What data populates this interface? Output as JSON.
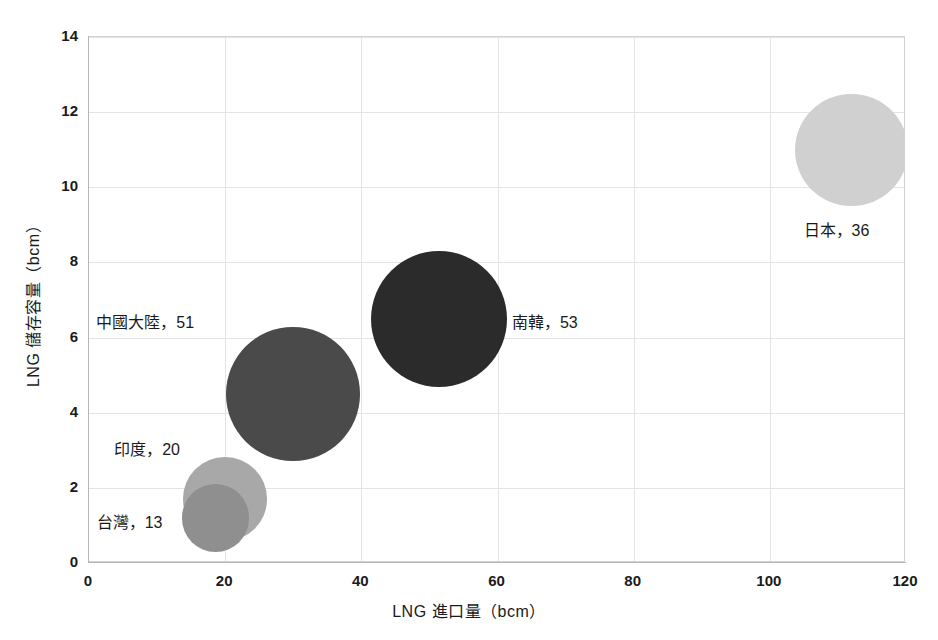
{
  "chart_data": {
    "type": "scatter",
    "subtype": "bubble",
    "title": "",
    "xlabel": "LNG 進口量（bcm）",
    "ylabel": "LNG 儲存容量（bcm）",
    "xlim": [
      0,
      120
    ],
    "ylim": [
      0,
      14
    ],
    "xticks": [
      "0",
      "20",
      "40",
      "60",
      "80",
      "100",
      "120"
    ],
    "yticks": [
      "0",
      "2",
      "4",
      "6",
      "8",
      "10",
      "12",
      "14"
    ],
    "xtick_values": [
      0,
      20,
      40,
      60,
      80,
      100,
      120
    ],
    "ytick_values": [
      0,
      2,
      4,
      6,
      8,
      10,
      12,
      14
    ],
    "grid": true,
    "legend": "none",
    "points": [
      {
        "name": "台灣",
        "label": "台灣，13",
        "x": 18.6,
        "y": 1.2,
        "size": 13,
        "color": "#8f8f8f",
        "label_pos": "left"
      },
      {
        "name": "印度",
        "label": "印度，20",
        "x": 20.0,
        "y": 1.7,
        "size": 20,
        "color": "#a8a8a8",
        "label_pos": "upper-left"
      },
      {
        "name": "中國大陸",
        "label": "中國大陸，51",
        "x": 30.0,
        "y": 4.5,
        "size": 51,
        "color": "#4a4a4a",
        "label_pos": "upper-left"
      },
      {
        "name": "南韓",
        "label": "南韓，53",
        "x": 51.4,
        "y": 6.5,
        "size": 53,
        "color": "#2b2b2b",
        "label_pos": "right"
      },
      {
        "name": "日本",
        "label": "日本，36",
        "x": 112.0,
        "y": 11.0,
        "size": 36,
        "color": "#d0d0d0",
        "label_pos": "below"
      }
    ]
  },
  "axes": {
    "x_title": "LNG 進口量（bcm）",
    "y_title": "LNG 儲存容量（bcm）",
    "x_ticks": [
      "0",
      "20",
      "40",
      "60",
      "80",
      "100",
      "120"
    ],
    "y_ticks": [
      "0",
      "2",
      "4",
      "6",
      "8",
      "10",
      "12",
      "14"
    ]
  },
  "labels": {
    "taiwan": "台灣，13",
    "india": "印度，20",
    "china": "中國大陸，51",
    "south_korea": "南韓，53",
    "japan": "日本，36"
  }
}
